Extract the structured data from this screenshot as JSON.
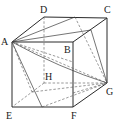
{
  "diagram": {
    "type": "cube",
    "labels": {
      "A": "A",
      "B": "B",
      "C": "C",
      "D": "D",
      "E": "E",
      "F": "F",
      "G": "G",
      "H": "H"
    },
    "vertices": {
      "A": [
        12,
        42
      ],
      "B": [
        73,
        42
      ],
      "C": [
        107,
        18
      ],
      "D": [
        44,
        17
      ],
      "E": [
        12,
        107
      ],
      "F": [
        73,
        107
      ],
      "G": [
        107,
        83
      ],
      "H": [
        44,
        83
      ]
    }
  }
}
